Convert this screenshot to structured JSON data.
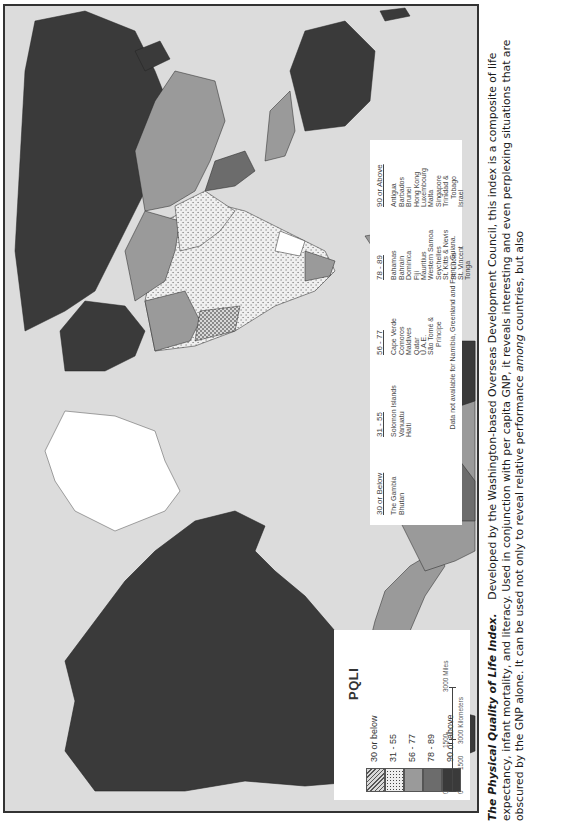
{
  "map": {
    "title": "PQLI",
    "legend_classes": [
      {
        "label": "30 or below",
        "pattern": "crosshatch",
        "color": "#c8c8c8"
      },
      {
        "label": "31 - 55",
        "pattern": "stipple",
        "color": "#e6e6e6"
      },
      {
        "label": "56 - 77",
        "pattern": "solid",
        "color": "#9a9a9a"
      },
      {
        "label": "78 - 89",
        "pattern": "solid",
        "color": "#6c6c6c"
      },
      {
        "label": "90 or above",
        "pattern": "solid",
        "color": "#3a3a3a"
      }
    ],
    "scale_bar": {
      "miles": [
        "0",
        "1500",
        "3000 Miles"
      ],
      "kilometers": [
        "0",
        "1500",
        "3000 Kilometers"
      ]
    },
    "no_data_color": "#ffffff",
    "ocean_color": "#dcdcdc"
  },
  "small_countries_legend": {
    "columns": [
      {
        "header": "30 or Below",
        "items": [
          "The Gambia",
          "Bhutan"
        ]
      },
      {
        "header": "31 - 55",
        "items": [
          "Solomon Islands",
          "Vanuatu",
          "Haiti"
        ]
      },
      {
        "header": "56 - 77",
        "items": [
          "Cape Verde",
          "Comoros",
          "Maldives",
          "Qatar",
          "U.A.E.",
          "São Tomé &",
          "  Príncipe"
        ]
      },
      {
        "header": "78 - 89",
        "items": [
          "Bahamas",
          "Bahrain",
          "Dominica",
          "Fiji",
          "Mauritius",
          "Western Samoa",
          "Seychelles",
          "St. Kitts & Nevis",
          "St. Lucia",
          "St. Vincent",
          "Tonga",
          "Lebanon"
        ]
      },
      {
        "header": "90 or Above",
        "items": [
          "Antigua",
          "Barbados",
          "Brunei",
          "Hong Kong",
          "Luxembourg",
          "Malta",
          "Singapore",
          "Trinidad &",
          "  Tobago",
          "Israel"
        ]
      }
    ],
    "note": "Data not available for Namibia, Greenland and French Guiana."
  },
  "caption": {
    "title": "The Physical Quality of Life Index.",
    "text_1": "Developed by the Washington-based Overseas Development Council, this index is a composite of life expectancy, infant mortality, and literacy. Used in conjunction with per capita GNP, it reveals interesting and even perplexing situations that are obscured by the GNP alone. It can be used not only to reveal relative performance ",
    "emphasis": "among",
    "text_2": " countries, but also"
  }
}
